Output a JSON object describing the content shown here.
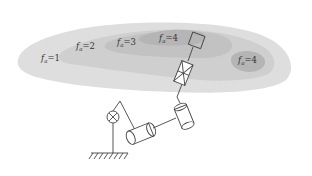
{
  "diagram": {
    "type": "robot workspace dexterity map",
    "regions": [
      {
        "id": "region-1",
        "symbol": "f",
        "subscript": "a",
        "value": "1",
        "label": "fa=1",
        "shade": "#d9d9d9"
      },
      {
        "id": "region-2",
        "symbol": "f",
        "subscript": "a",
        "value": "2",
        "label": "fa=2",
        "shade": "#cdcdcd"
      },
      {
        "id": "region-3",
        "symbol": "f",
        "subscript": "a",
        "value": "3",
        "label": "fa=3",
        "shade": "#c2c2c2"
      },
      {
        "id": "region-4a",
        "symbol": "f",
        "subscript": "a",
        "value": "4",
        "label": "fa=4",
        "shade": "#b3b3b3"
      },
      {
        "id": "region-4b",
        "symbol": "f",
        "subscript": "a",
        "value": "4",
        "label": "fa=4",
        "shade": "#b3b3b3"
      }
    ],
    "mechanism": {
      "components": [
        "ground-base",
        "revolute-joint-cross",
        "cylindrical-joint-1",
        "cylindrical-joint-2",
        "prismatic-joint-crossed-box",
        "end-effector-square"
      ]
    },
    "colors": {
      "background": "#ffffff",
      "workspace_outer": "#dedede",
      "workspace_mid": "#cccccc",
      "workspace_inner": "#b8b8b8",
      "line": "#444444"
    }
  }
}
